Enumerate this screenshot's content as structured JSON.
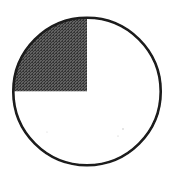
{
  "figure": {
    "name": "fraction-circle-quarter-shaded",
    "alt_text": "Circle divided into four equal quarters by a vertical and a horizontal diameter, with the upper-left quarter shaded dark gray",
    "background_color": "#ffffff",
    "width": 175,
    "height": 173
  },
  "chart_data": {
    "type": "pie",
    "title": "",
    "subtitle": "",
    "xlabel": "",
    "ylabel": "",
    "legend_position": "none",
    "grid": false,
    "categories": [
      "Upper-left quarter",
      "Upper-right quarter",
      "Lower-right quarter",
      "Lower-left quarter"
    ],
    "values": [
      25,
      25,
      25,
      25
    ],
    "value_unit": "percent",
    "fraction_shaded": "1/4",
    "shaded_count": 1,
    "total_parts": 4,
    "slice_fills": [
      "#4d4d4d",
      "#ffffff",
      "#ffffff",
      "#ffffff"
    ],
    "slice_labels": [
      "",
      "",
      "",
      ""
    ],
    "annotations": []
  },
  "geometry": {
    "center_x": 87,
    "center_y": 91.5,
    "radius": 75,
    "outline_color": "#1a1a1a",
    "outline_width": 2.6,
    "divider_color": "#4a4a4a",
    "divider_width": 1.6,
    "vertical_divider_x": 87,
    "horizontal_divider_y": 92
  },
  "shading": {
    "quadrant": "upper-left",
    "fill_color": "#4d4d4d",
    "pattern": "halftone-dither",
    "pattern_dot_color": "#2b2b2b",
    "pattern_gap_color": "#6a6a6a"
  },
  "speckles": [
    {
      "cx": 123,
      "cy": 129,
      "r": 0.7,
      "color": "#b9b9b9"
    },
    {
      "cx": 118,
      "cy": 136,
      "r": 0.6,
      "color": "#c4c4c4"
    },
    {
      "cx": 47,
      "cy": 132,
      "r": 0.6,
      "color": "#d0d0d0"
    },
    {
      "cx": 140,
      "cy": 42,
      "r": 0.5,
      "color": "#d6d6d6"
    }
  ]
}
